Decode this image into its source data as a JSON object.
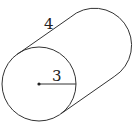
{
  "figure": {
    "type": "cylinder",
    "labels": {
      "length": "4",
      "radius": "3"
    },
    "geometry": {
      "front_center": [
        39,
        84
      ],
      "back_center": [
        92,
        47
      ],
      "radius": 37
    },
    "colors": {
      "stroke": "#333333",
      "background": "#ffffff"
    }
  }
}
